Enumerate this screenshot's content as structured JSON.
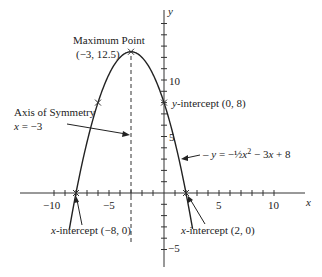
{
  "chart_data": {
    "type": "line",
    "title": "",
    "xlabel": "x",
    "ylabel": "y",
    "xlim": [
      -13,
      13
    ],
    "ylim": [
      -6.5,
      17
    ],
    "grid": false,
    "x_ticks": [
      -9,
      -8,
      -7,
      -6,
      -5,
      -4,
      -3,
      -2,
      -1,
      1,
      2,
      3,
      4,
      5,
      6,
      7,
      8,
      9,
      10,
      -10
    ],
    "x_tick_labels": [
      {
        "value": -10,
        "label": "−10"
      },
      {
        "value": -5,
        "label": "−5"
      },
      {
        "value": 5,
        "label": "5"
      },
      {
        "value": 10,
        "label": "10"
      }
    ],
    "y_tick_labels": [
      {
        "value": 10,
        "label": "10"
      },
      {
        "value": 5,
        "label": "5"
      },
      {
        "value": -5,
        "label": "−5"
      }
    ],
    "series": [
      {
        "name": "y = −½x² − 3x + 8",
        "function": {
          "a": -0.5,
          "b": -3,
          "c": 8
        },
        "x_range": [
          -8.6,
          2.6
        ],
        "key_points": [
          {
            "x": -8,
            "y": 0,
            "label": "x-intercept (−8, 0)"
          },
          {
            "x": -6,
            "y": 8
          },
          {
            "x": -3,
            "y": 12.5,
            "label": "Maximum Point (−3, 12.5)"
          },
          {
            "x": 0,
            "y": 8,
            "label": "y-intercept (0, 8)"
          },
          {
            "x": 2,
            "y": 0,
            "label": "x-intercept (2, 0)"
          }
        ]
      }
    ],
    "annotations": [
      {
        "text": "Maximum Point",
        "sub": "(−3, 12.5)"
      },
      {
        "text": "Axis of Symmetry",
        "sub": "x = −3"
      },
      {
        "text": "y-intercept (0, 8)"
      },
      {
        "text": "x-intercept (−8, 0)"
      },
      {
        "text": "x-intercept (2, 0)"
      },
      {
        "text": "y = −½x² − 3x + 8"
      }
    ],
    "axis_of_symmetry": -3
  },
  "labels": {
    "x_axis": "x",
    "y_axis": "y",
    "max_title": "Maximum Point",
    "max_coords": "(−3, 12.5)",
    "aos_title": "Axis of Symmetry",
    "aos_eq_var": "x",
    "aos_eq_rest": " = −3",
    "yint_var": "y",
    "yint_rest": "-intercept (0, 8)",
    "xint_left_var": "x",
    "xint_left_rest": "-intercept (−8, 0)",
    "xint_right_var": "x",
    "xint_right_rest": "-intercept (2, 0)",
    "eq_y": "y",
    "eq_mid": " = −",
    "eq_frac": "½",
    "eq_x": "x",
    "eq_sq": "2",
    "eq_rest1": " − 3",
    "eq_x2": "x",
    "eq_rest2": " + 8",
    "tick_neg10": "−10",
    "tick_neg5": "−5",
    "tick_5": "5",
    "tick_10": "10",
    "ytick_10": "10",
    "ytick_5": "5",
    "ytick_neg5": "−5"
  }
}
